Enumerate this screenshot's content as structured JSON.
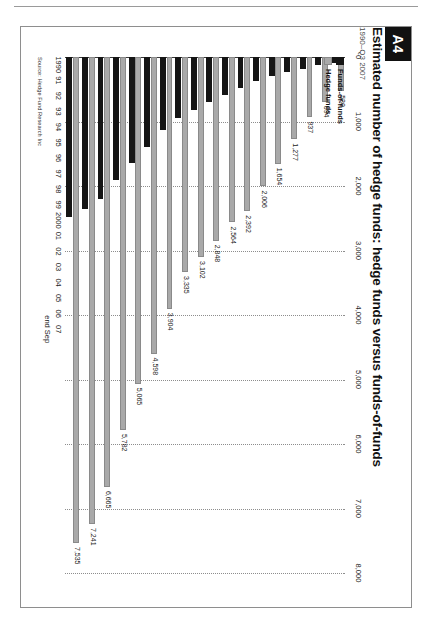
{
  "page": {
    "badge": "A4"
  },
  "header": {
    "title": "Estimated number of hedge funds: hedge funds versus funds-of-funds",
    "subtitle": "1990–Q3 2007"
  },
  "legend": {
    "items": [
      {
        "label": "Funds-of-funds",
        "color": "#151515"
      },
      {
        "label": "Hedge funds",
        "color": "#a9a9a9"
      }
    ]
  },
  "source": "Source: Hedge Fund Research Inc",
  "axis_note": "end Sep",
  "colors": {
    "hedge_funds": "#a9a9a9",
    "funds_of_funds": "#151515",
    "grid": "#8d8d8d",
    "axis": "#3a3a3a",
    "badge_bg": "#111111"
  },
  "chart_data": {
    "type": "bar",
    "orientation": "horizontal",
    "title": "Estimated number of hedge funds: hedge funds versus funds-of-funds",
    "subtitle": "1990–Q3 2007",
    "xlabel": "",
    "ylabel": "",
    "xlim": [
      0,
      8000
    ],
    "xticks": [
      "0",
      "1,000",
      "2,000",
      "3,000",
      "4,000",
      "5,000",
      "6,000",
      "7,000",
      "8,000"
    ],
    "xtick_values": [
      0,
      1000,
      2000,
      3000,
      4000,
      5000,
      6000,
      7000,
      8000
    ],
    "grid": true,
    "legend_position": "bottom-left",
    "categories": [
      "1990",
      "91",
      "92",
      "93",
      "94",
      "95",
      "96",
      "97",
      "98",
      "99",
      "2000",
      "01",
      "02",
      "03",
      "04",
      "05",
      "06",
      "07"
    ],
    "series": [
      {
        "name": "Hedge funds",
        "color": "#a9a9a9",
        "values": [
          530,
          694,
          937,
          1277,
          1654,
          2006,
          2392,
          2564,
          2848,
          3102,
          3335,
          3904,
          4598,
          5065,
          5782,
          6665,
          7241,
          7535
        ],
        "labels": [
          "530",
          "694",
          "937",
          "1,277",
          "1,654",
          "2,006",
          "2,392",
          "2,564",
          "2,848",
          "3,102",
          "3,335",
          "3,904",
          "4,598",
          "5,065",
          "5,782",
          "6,665",
          "7,241",
          "7,535"
        ]
      },
      {
        "name": "Funds-of-funds",
        "color": "#151515",
        "values": [
          95,
          130,
          180,
          235,
          290,
          370,
          480,
          585,
          700,
          820,
          940,
          1130,
          1400,
          1650,
          1900,
          2200,
          2350,
          2480
        ],
        "labels": [
          "",
          "",
          "",
          "",
          "",
          "",
          "",
          "",
          "",
          "",
          "",
          "",
          "",
          "",
          "",
          "",
          "",
          ""
        ]
      }
    ]
  }
}
